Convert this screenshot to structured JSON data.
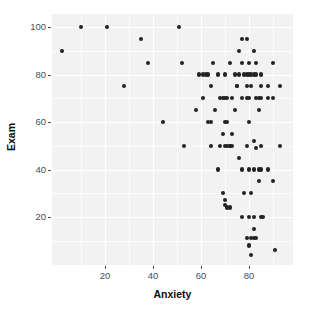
{
  "chart_data": {
    "type": "scatter",
    "title": "",
    "xlabel": "Anxiety",
    "ylabel": "Exam",
    "xlim": [
      0,
      96
    ],
    "ylim": [
      0,
      104
    ],
    "grid": true,
    "legend": null,
    "x_ticks": [
      20,
      40,
      60,
      80
    ],
    "y_ticks": [
      20,
      40,
      60,
      80,
      100
    ],
    "x_tick_labels": [
      "20",
      "40",
      "60",
      "80"
    ],
    "y_tick_labels": [
      "20",
      "40",
      "60",
      "80",
      "100"
    ],
    "point_color": "#232323",
    "panel_background": "#f2f2f2",
    "gridline_color": "#ffffff",
    "series": [
      {
        "name": "students",
        "points": [
          [
            2,
            90
          ],
          [
            10,
            100
          ],
          [
            21,
            100
          ],
          [
            28,
            75
          ],
          [
            35,
            95
          ],
          [
            38,
            85
          ],
          [
            44,
            60
          ],
          [
            51,
            100
          ],
          [
            52,
            85
          ],
          [
            53,
            50
          ],
          [
            58,
            65
          ],
          [
            59,
            80
          ],
          [
            61,
            80
          ],
          [
            61,
            70
          ],
          [
            62,
            80
          ],
          [
            63,
            80
          ],
          [
            63,
            60
          ],
          [
            64,
            75
          ],
          [
            64,
            60
          ],
          [
            64,
            50
          ],
          [
            65,
            85
          ],
          [
            66,
            65
          ],
          [
            67,
            80
          ],
          [
            67,
            40
          ],
          [
            68,
            70
          ],
          [
            68,
            50
          ],
          [
            69,
            70
          ],
          [
            69,
            55
          ],
          [
            69,
            30
          ],
          [
            70,
            80
          ],
          [
            70,
            70
          ],
          [
            70,
            60
          ],
          [
            70,
            50
          ],
          [
            70,
            27
          ],
          [
            70,
            25
          ],
          [
            71,
            70
          ],
          [
            71,
            60
          ],
          [
            71,
            50
          ],
          [
            71,
            24
          ],
          [
            72,
            85
          ],
          [
            72,
            50
          ],
          [
            72,
            50
          ],
          [
            72,
            24
          ],
          [
            73,
            70
          ],
          [
            73,
            55
          ],
          [
            73,
            50
          ],
          [
            74,
            80
          ],
          [
            74,
            65
          ],
          [
            75,
            75
          ],
          [
            75,
            75
          ],
          [
            76,
            90
          ],
          [
            76,
            80
          ],
          [
            76,
            45
          ],
          [
            77,
            95
          ],
          [
            77,
            85
          ],
          [
            77,
            70
          ],
          [
            77,
            40
          ],
          [
            77,
            20
          ],
          [
            78,
            80
          ],
          [
            78,
            30
          ],
          [
            79,
            95
          ],
          [
            79,
            80
          ],
          [
            79,
            75
          ],
          [
            79,
            70
          ],
          [
            79,
            50
          ],
          [
            79,
            11
          ],
          [
            80,
            85
          ],
          [
            80,
            80
          ],
          [
            80,
            70
          ],
          [
            80,
            60
          ],
          [
            80,
            40
          ],
          [
            80,
            20
          ],
          [
            80,
            8
          ],
          [
            81,
            80
          ],
          [
            81,
            75
          ],
          [
            81,
            30
          ],
          [
            81,
            11
          ],
          [
            81,
            4
          ],
          [
            82,
            90
          ],
          [
            82,
            80
          ],
          [
            82,
            52
          ],
          [
            82,
            40
          ],
          [
            82,
            20
          ],
          [
            82,
            15
          ],
          [
            82,
            11
          ],
          [
            83,
            85
          ],
          [
            83,
            80
          ],
          [
            83,
            70
          ],
          [
            83,
            49
          ],
          [
            83,
            11
          ],
          [
            84,
            70
          ],
          [
            84,
            65
          ],
          [
            84,
            40
          ],
          [
            84,
            35
          ],
          [
            85,
            80
          ],
          [
            85,
            75
          ],
          [
            85,
            70
          ],
          [
            85,
            50
          ],
          [
            85,
            40
          ],
          [
            85,
            20
          ],
          [
            86,
            20
          ],
          [
            88,
            75
          ],
          [
            88,
            70
          ],
          [
            88,
            40
          ],
          [
            90,
            85
          ],
          [
            90,
            70
          ],
          [
            90,
            35
          ],
          [
            91,
            6
          ],
          [
            93,
            75
          ],
          [
            93,
            50
          ]
        ]
      }
    ]
  }
}
